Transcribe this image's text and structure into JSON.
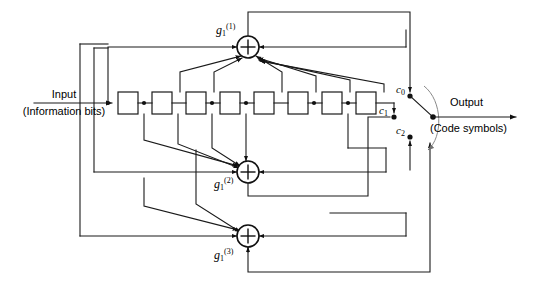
{
  "figure": {
    "kind": "convolutional-encoder-block-diagram",
    "width": 542,
    "height": 293,
    "background_color": "#ffffff",
    "line_color": "#1a1a1a",
    "arc_color": "#8a8a8a"
  },
  "labels": {
    "input_title": "Input",
    "input_subtitle": "(Information bits)",
    "output_title": "Output",
    "output_subtitle": "(Code symbols)"
  },
  "generators": [
    {
      "id": "g1",
      "base": "g",
      "sub": "1",
      "sup": "(1)",
      "text": "g",
      "role": "top-adder-label"
    },
    {
      "id": "g2",
      "base": "g",
      "sub": "1",
      "sup": "(2)",
      "text": "g",
      "role": "middle-adder-label"
    },
    {
      "id": "g3",
      "base": "g",
      "sub": "1",
      "sup": "(3)",
      "text": "g",
      "role": "bottom-adder-label"
    }
  ],
  "switch_taps": [
    {
      "id": "c0",
      "base": "c",
      "sub": "0",
      "text": "c"
    },
    {
      "id": "c1",
      "base": "c",
      "sub": "1",
      "text": "c"
    },
    {
      "id": "c2",
      "base": "c",
      "sub": "2",
      "text": "c"
    }
  ],
  "shift_register": {
    "stage_count": 8,
    "box_width": 20,
    "box_height": 22,
    "y_top": 92,
    "x_positions": [
      118,
      152,
      186,
      220,
      254,
      288,
      322,
      356
    ]
  },
  "adders": [
    {
      "id": "adder-g1",
      "cx": 248,
      "cy": 47,
      "r": 11
    },
    {
      "id": "adder-g2",
      "cx": 248,
      "cy": 172,
      "r": 11
    },
    {
      "id": "adder-g3",
      "cx": 248,
      "cy": 236,
      "r": 11
    }
  ],
  "switch": {
    "pivot_x": 433,
    "pivot_y": 117,
    "contacts": [
      {
        "id": "c0",
        "x": 410,
        "y": 96
      },
      {
        "id": "c1",
        "x": 394,
        "y": 117
      },
      {
        "id": "c2",
        "x": 410,
        "y": 137
      }
    ]
  }
}
